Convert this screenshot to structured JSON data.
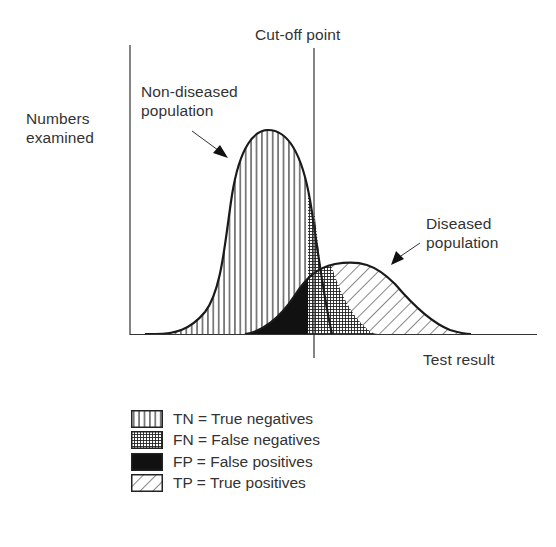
{
  "diagram": {
    "y_axis_label_line1": "Numbers",
    "y_axis_label_line2": "examined",
    "x_axis_label": "Test result",
    "cutoff_label": "Cut-off point",
    "non_diseased_label_line1": "Non-diseased",
    "non_diseased_label_line2": "population",
    "diseased_label_line1": "Diseased",
    "diseased_label_line2": "population"
  },
  "legend": {
    "items": [
      {
        "code": "TN",
        "label": "TN = True negatives",
        "pattern": "vertical-lines"
      },
      {
        "code": "FN",
        "label": "FN = False negatives",
        "pattern": "grid-crosshatch"
      },
      {
        "code": "FP",
        "label": "FP = False positives",
        "pattern": "solid-black"
      },
      {
        "code": "TP",
        "label": "TP = True positives",
        "pattern": "diagonal-lines"
      }
    ]
  },
  "caption_fragment": "... the ideal test would be one with sensitivity and specificity of 100 per cent ...",
  "colors": {
    "ink": "#222222",
    "background": "#ffffff"
  }
}
